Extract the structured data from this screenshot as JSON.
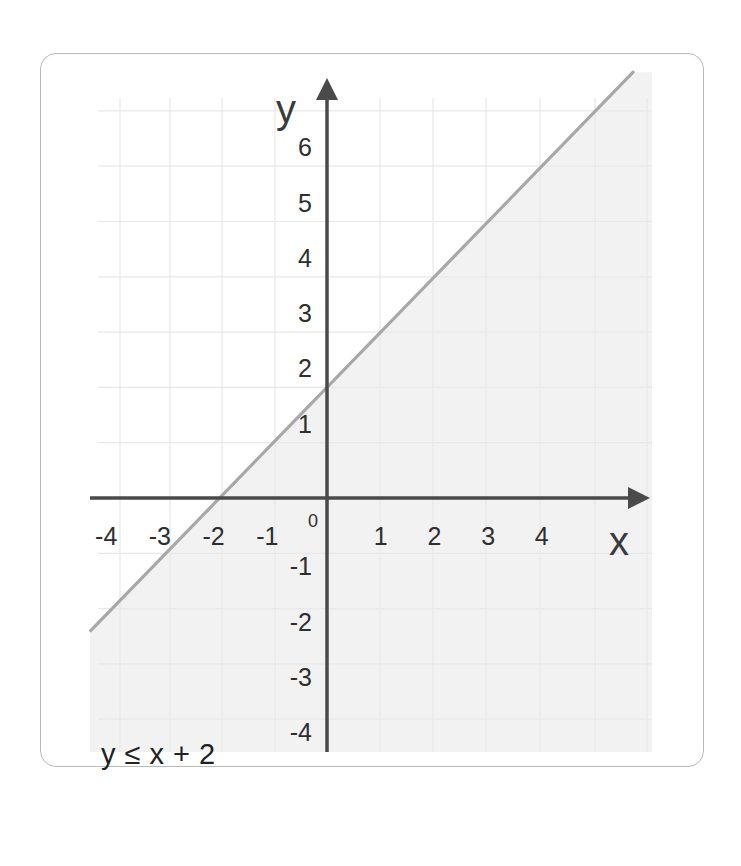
{
  "caption": "y ≤ x + 2",
  "chart_data": {
    "type": "line",
    "title": "",
    "annotation": "y ≤ x + 2",
    "xlabel": "x",
    "ylabel": "y",
    "xlim": [
      -4.5,
      5.8
    ],
    "ylim": [
      -4.6,
      7.6
    ],
    "grid": true,
    "legend": null,
    "x_ticks": [
      -4,
      -3,
      -2,
      -1,
      1,
      2,
      3,
      4
    ],
    "y_ticks": [
      6,
      5,
      4,
      3,
      2,
      1,
      -1,
      -2,
      -3,
      -4
    ],
    "origin_label": "0",
    "series": [
      {
        "name": "boundary y = x + 2",
        "style": "solid",
        "color": "#a8a8a8",
        "x": [
          -4.4,
          5.7
        ],
        "y": [
          -2.4,
          7.7
        ]
      }
    ],
    "shaded_region": {
      "description": "area below the line y = x + 2 (y ≤ x + 2)",
      "color": "#f2f2f2"
    },
    "colors": {
      "axis": "#4a4a4a",
      "grid": "#e8e8e8",
      "line": "#a8a8a8",
      "shade": "#f2f2f2"
    }
  }
}
